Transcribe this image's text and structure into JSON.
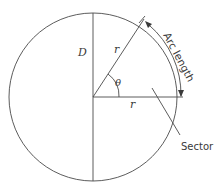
{
  "diagram": {
    "labels": {
      "diameter": "D",
      "radius_upper": "r",
      "radius_lower": "r",
      "angle": "θ",
      "arc_length": "Arc length",
      "sector": "Sector"
    },
    "colors": {
      "stroke": "#4a4a4a",
      "text": "#3a3a3a",
      "background": "#ffffff"
    }
  }
}
